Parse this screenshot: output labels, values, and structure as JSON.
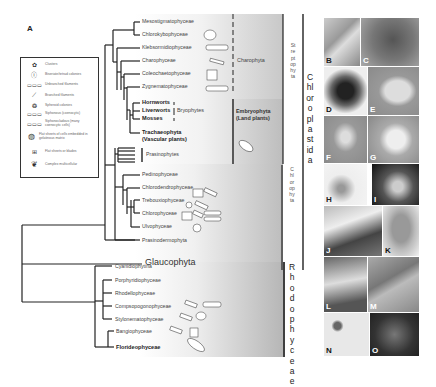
{
  "panel_label": "A",
  "legend": {
    "items": [
      {
        "icon": "clusters-icon",
        "label": "Clusters"
      },
      {
        "icon": "biseriate-colonies-icon",
        "label": "Biseriate/tetrad colonies"
      },
      {
        "icon": "unbranched-filaments-icon",
        "label": "Unbranched filaments"
      },
      {
        "icon": "branched-filaments-icon",
        "label": "Branched filaments"
      },
      {
        "icon": "spheroid-colonies-icon",
        "label": "Spheroid colonies"
      },
      {
        "icon": "siphonous-icon",
        "label": "Siphonous (coenocytic)"
      },
      {
        "icon": "siphonocladous-icon",
        "label": "Siphonocladous (many coenocytic cells)"
      },
      {
        "icon": "flat-sheets-gelatinous-icon",
        "label": "Flat sheets of cells embedded in gelatinous matrix"
      },
      {
        "icon": "flat-sheets-icon",
        "label": "Flat sheets or blades"
      },
      {
        "icon": "complex-multicellular-icon",
        "label": "Complex multicellular"
      }
    ]
  },
  "streptophyta_taxa": [
    {
      "name": "Mesostigmatophyceae",
      "bold": false
    },
    {
      "name": "Chlorokybophyceae",
      "bold": false
    },
    {
      "name": "Klebsormidiophyceae",
      "bold": false
    },
    {
      "name": "Charophyceae",
      "bold": false
    },
    {
      "name": "Coleochaetophyceae",
      "bold": false
    },
    {
      "name": "Zygnematophyceae",
      "bold": false
    },
    {
      "name": "Hornworts",
      "bold": true
    },
    {
      "name": "Liverworts",
      "bold": true
    },
    {
      "name": "Mosses",
      "bold": true
    },
    {
      "name": "Trachaeophyta",
      "bold": true
    },
    {
      "name": "(Vascular plants)",
      "bold": true
    }
  ],
  "chlorophyta_taxa": [
    {
      "name": "Prasinophytes"
    },
    {
      "name": "Pedinophyceae"
    },
    {
      "name": "Chlorodendrophyceae"
    },
    {
      "name": "Trebouxiophyceae"
    },
    {
      "name": "Chlorophyceae"
    },
    {
      "name": "Ulvophyceae"
    },
    {
      "name": "Prasinodermophyta"
    }
  ],
  "glaucophyta": "Glaucophyta",
  "rhodophyta_taxa": [
    {
      "name": "Cyanidiophytina",
      "bold": false
    },
    {
      "name": "Porphyridiophyceae",
      "bold": false
    },
    {
      "name": "Rhodellophyceae",
      "bold": false
    },
    {
      "name": "Compsopogonophyceae",
      "bold": false
    },
    {
      "name": "Stylonematophyceae",
      "bold": false
    },
    {
      "name": "Bangiophyceae",
      "bold": false
    },
    {
      "name": "Florideophyceae",
      "bold": true
    }
  ],
  "groups": {
    "charophyta": "Charophyta",
    "bryophytes": "Bryophytes",
    "embryophyta": "Embryophyta",
    "land_plants": "(Land plants)",
    "streptophyta": "Streptophyta",
    "chlorophyta": "Chlorophyta",
    "chloroplastida": "Chloroplastida",
    "rhodophyceae": "Rhodophyceae"
  },
  "photo_panels": [
    "B",
    "C",
    "D",
    "E",
    "F",
    "G",
    "H",
    "I",
    "J",
    "K",
    "L",
    "M",
    "N",
    "O"
  ],
  "colors": {
    "line": "#222222",
    "shade_dark": "#b8b8b8",
    "text": "#444444"
  }
}
